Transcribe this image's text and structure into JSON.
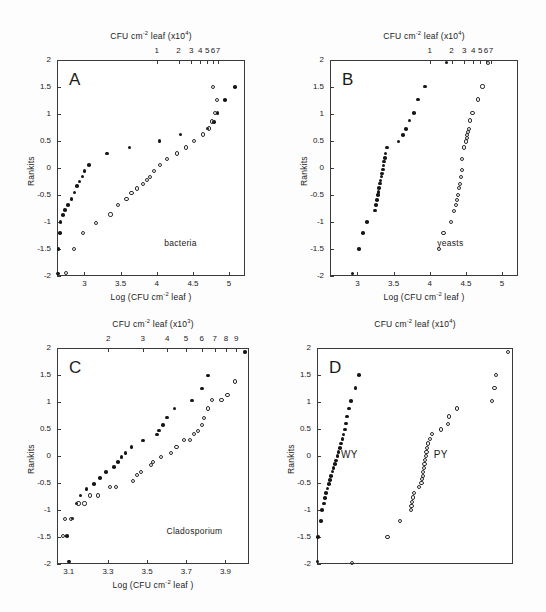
{
  "figure": {
    "y_axis_label": "Rankits",
    "y_ticks": [
      2,
      1.5,
      1,
      0.5,
      0,
      -0.5,
      -1,
      -1.5,
      -2
    ],
    "y_tick_labels": [
      "2",
      "1.5",
      "1",
      "0.5",
      "0",
      "-0.5",
      "-1",
      "-1.5",
      "-2"
    ],
    "bottom_axis_title": "Log (CFU cm-2 leaf )"
  },
  "chart_data": [
    {
      "type": "scatter",
      "panel": "A",
      "panel_letter": "A",
      "annotation": "bacteria",
      "title": "",
      "top_axis_title": "CFU cm-2 leaf (x104)",
      "top_axis_multiplier": "x10^4",
      "top_ticks": [
        1,
        2,
        3,
        4,
        5,
        6,
        7
      ],
      "top_tick_labels": [
        "1",
        "2",
        "3",
        "4",
        "5",
        "6",
        "7"
      ],
      "xlabel": "Log (CFU cm-2 leaf )",
      "x_ticks": [
        3,
        3.5,
        4,
        4.5,
        5
      ],
      "x_tick_labels": [
        "3",
        "3.5",
        "4",
        "4.5",
        "5"
      ],
      "xlim": [
        2.62,
        5.22
      ],
      "ylabel": "Rankits",
      "ylim": [
        -2,
        2
      ],
      "grid": false,
      "legend": "none",
      "series": [
        {
          "name": "filled",
          "marker": "filled-circle",
          "points": [
            [
              2.63,
              -1.95
            ],
            [
              2.64,
              -1.5
            ],
            [
              2.66,
              -1.2
            ],
            [
              2.67,
              -1.0
            ],
            [
              2.7,
              -0.87
            ],
            [
              2.73,
              -0.78
            ],
            [
              2.77,
              -0.68
            ],
            [
              2.82,
              -0.57
            ],
            [
              2.86,
              -0.45
            ],
            [
              2.9,
              -0.33
            ],
            [
              2.93,
              -0.25
            ],
            [
              2.97,
              -0.16
            ],
            [
              3.0,
              -0.06
            ],
            [
              3.06,
              0.06
            ],
            [
              3.31,
              0.27
            ],
            [
              3.62,
              0.38
            ],
            [
              4.04,
              0.5
            ],
            [
              4.33,
              0.62
            ],
            [
              4.7,
              0.73
            ],
            [
              4.79,
              0.85
            ],
            [
              4.84,
              1.02
            ],
            [
              4.94,
              1.26
            ],
            [
              5.08,
              1.5
            ]
          ]
        },
        {
          "name": "open",
          "marker": "open-circle",
          "points": [
            [
              2.74,
              -1.95
            ],
            [
              2.86,
              -1.5
            ],
            [
              2.98,
              -1.2
            ],
            [
              3.16,
              -1.02
            ],
            [
              3.36,
              -0.86
            ],
            [
              3.46,
              -0.69
            ],
            [
              3.58,
              -0.57
            ],
            [
              3.65,
              -0.47
            ],
            [
              3.73,
              -0.38
            ],
            [
              3.81,
              -0.3
            ],
            [
              3.86,
              -0.22
            ],
            [
              3.91,
              -0.16
            ],
            [
              3.96,
              -0.06
            ],
            [
              4.04,
              0.06
            ],
            [
              4.14,
              0.17
            ],
            [
              4.28,
              0.27
            ],
            [
              4.4,
              0.38
            ],
            [
              4.52,
              0.5
            ],
            [
              4.64,
              0.62
            ],
            [
              4.72,
              0.73
            ],
            [
              4.76,
              0.86
            ],
            [
              4.81,
              1.02
            ],
            [
              4.83,
              1.26
            ],
            [
              4.78,
              1.5
            ]
          ]
        }
      ]
    },
    {
      "type": "scatter",
      "panel": "B",
      "panel_letter": "B",
      "annotation": "yeasts",
      "title": "",
      "top_axis_title": "CFU cm-2 leaf (x104)",
      "top_axis_multiplier": "x10^4",
      "top_ticks": [
        1,
        2,
        3,
        4,
        5,
        6,
        7
      ],
      "top_tick_labels": [
        "1",
        "2",
        "3",
        "4",
        "5",
        "6",
        "7"
      ],
      "xlabel": "Log (CFU cm-2 leaf )",
      "x_ticks": [
        3,
        3.5,
        4,
        4.5,
        5
      ],
      "x_tick_labels": [
        "3",
        "3.5",
        "4",
        "4.5",
        "5"
      ],
      "xlim": [
        2.62,
        5.22
      ],
      "ylabel": "Rankits",
      "ylim": [
        -2,
        2
      ],
      "grid": false,
      "legend": "none",
      "series": [
        {
          "name": "filled",
          "marker": "filled-circle",
          "points": [
            [
              2.93,
              -1.95
            ],
            [
              3.02,
              -1.5
            ],
            [
              3.08,
              -1.2
            ],
            [
              3.13,
              -1.0
            ],
            [
              3.24,
              -0.79
            ],
            [
              3.26,
              -0.68
            ],
            [
              3.27,
              -0.59
            ],
            [
              3.28,
              -0.5
            ],
            [
              3.29,
              -0.44
            ],
            [
              3.3,
              -0.37
            ],
            [
              3.31,
              -0.29
            ],
            [
              3.32,
              -0.23
            ],
            [
              3.33,
              -0.16
            ],
            [
              3.34,
              -0.1
            ],
            [
              3.35,
              -0.03
            ],
            [
              3.36,
              0.05
            ],
            [
              3.37,
              0.12
            ],
            [
              3.38,
              0.19
            ],
            [
              3.39,
              0.27
            ],
            [
              3.41,
              0.38
            ],
            [
              3.57,
              0.49
            ],
            [
              3.63,
              0.61
            ],
            [
              3.67,
              0.72
            ],
            [
              3.72,
              0.88
            ],
            [
              3.78,
              1.02
            ],
            [
              3.84,
              1.27
            ],
            [
              3.93,
              1.51
            ],
            [
              4.23,
              1.95
            ]
          ]
        },
        {
          "name": "open",
          "marker": "open-circle",
          "points": [
            [
              4.13,
              -1.5
            ],
            [
              4.19,
              -1.2
            ],
            [
              4.29,
              -1.0
            ],
            [
              4.33,
              -0.79
            ],
            [
              4.36,
              -0.68
            ],
            [
              4.38,
              -0.59
            ],
            [
              4.39,
              -0.5
            ],
            [
              4.4,
              -0.37
            ],
            [
              4.42,
              -0.29
            ],
            [
              4.43,
              -0.16
            ],
            [
              4.44,
              -0.03
            ],
            [
              4.45,
              0.17
            ],
            [
              4.47,
              0.38
            ],
            [
              4.5,
              0.49
            ],
            [
              4.51,
              0.55
            ],
            [
              4.52,
              0.61
            ],
            [
              4.53,
              0.66
            ],
            [
              4.54,
              0.72
            ],
            [
              4.56,
              0.88
            ],
            [
              4.59,
              1.02
            ],
            [
              4.67,
              1.27
            ],
            [
              4.73,
              1.51
            ],
            [
              4.8,
              1.95
            ]
          ]
        }
      ]
    },
    {
      "type": "scatter",
      "panel": "C",
      "panel_letter": "C",
      "annotation": "Cladosporium",
      "title": "",
      "top_axis_title": "CFU cm-2 leaf (x103)",
      "top_axis_multiplier": "x10^3",
      "top_ticks": [
        1,
        2,
        3,
        4,
        5,
        6,
        7,
        8,
        9
      ],
      "top_tick_labels": [
        "1",
        "2",
        "3",
        "4",
        "5",
        "6",
        "7",
        "8",
        "9"
      ],
      "xlabel": "Log (CFU cm-2 leaf )",
      "x_ticks": [
        3.1,
        3.3,
        3.5,
        3.7,
        3.9
      ],
      "x_tick_labels": [
        "3.1",
        "3.3",
        "3.5",
        "3.7",
        "3.9"
      ],
      "xlim": [
        3.04,
        4.02
      ],
      "ylabel": "Rankits",
      "ylim": [
        -2,
        2
      ],
      "grid": false,
      "legend": "none",
      "series": [
        {
          "name": "filled",
          "marker": "filled-circle",
          "points": [
            [
              3.1,
              -1.95
            ],
            [
              3.09,
              -1.48
            ],
            [
              3.12,
              -1.16
            ],
            [
              3.14,
              -0.88
            ],
            [
              3.16,
              -0.73
            ],
            [
              3.19,
              -0.61
            ],
            [
              3.23,
              -0.52
            ],
            [
              3.26,
              -0.41
            ],
            [
              3.29,
              -0.3
            ],
            [
              3.33,
              -0.2
            ],
            [
              3.35,
              -0.11
            ],
            [
              3.37,
              -0.02
            ],
            [
              3.39,
              0.06
            ],
            [
              3.42,
              0.17
            ],
            [
              3.48,
              0.29
            ],
            [
              3.55,
              0.4
            ],
            [
              3.56,
              0.47
            ],
            [
              3.58,
              0.57
            ],
            [
              3.6,
              0.71
            ],
            [
              3.64,
              0.88
            ],
            [
              3.73,
              1.03
            ],
            [
              3.78,
              1.25
            ],
            [
              3.81,
              1.49
            ],
            [
              4.0,
              1.93
            ]
          ]
        },
        {
          "name": "open",
          "marker": "open-circle",
          "points": [
            [
              3.07,
              -1.48
            ],
            [
              3.08,
              -1.16
            ],
            [
              3.11,
              -1.16
            ],
            [
              3.15,
              -0.88
            ],
            [
              3.18,
              -0.88
            ],
            [
              3.21,
              -0.73
            ],
            [
              3.25,
              -0.73
            ],
            [
              3.31,
              -0.58
            ],
            [
              3.34,
              -0.58
            ],
            [
              3.43,
              -0.47
            ],
            [
              3.45,
              -0.35
            ],
            [
              3.47,
              -0.3
            ],
            [
              3.52,
              -0.16
            ],
            [
              3.53,
              -0.11
            ],
            [
              3.57,
              -0.02
            ],
            [
              3.62,
              0.06
            ],
            [
              3.65,
              0.17
            ],
            [
              3.69,
              0.29
            ],
            [
              3.72,
              0.29
            ],
            [
              3.74,
              0.4
            ],
            [
              3.76,
              0.47
            ],
            [
              3.78,
              0.57
            ],
            [
              3.79,
              0.71
            ],
            [
              3.81,
              0.88
            ],
            [
              3.83,
              1.03
            ],
            [
              3.88,
              1.03
            ],
            [
              3.91,
              1.13
            ],
            [
              3.95,
              1.38
            ],
            [
              4.0,
              1.93
            ]
          ]
        }
      ]
    },
    {
      "type": "scatter",
      "panel": "D",
      "panel_letter": "D",
      "annotations": [
        "WY",
        "PY"
      ],
      "title": "",
      "top_axis_title": "CFU cm-2 leaf (x104)",
      "top_axis_multiplier": "x10^4",
      "top_ticks": [
        0.5,
        1,
        1.5,
        2,
        2.5,
        3
      ],
      "top_tick_labels": [
        "0.5",
        "1",
        "1.5",
        "2",
        "2.5",
        "3"
      ],
      "xlabel": "",
      "x_ticks": [],
      "x_tick_labels": [],
      "xlim": [
        0.03,
        3.2
      ],
      "ylabel": "Rankits",
      "ylim": [
        -2,
        2
      ],
      "grid": false,
      "legend": "none",
      "series": [
        {
          "name": "WY",
          "marker": "filled-circle",
          "points": [
            [
              0.04,
              -1.95
            ],
            [
              0.05,
              -1.5
            ],
            [
              0.09,
              -1.2
            ],
            [
              0.11,
              -1.0
            ],
            [
              0.14,
              -0.88
            ],
            [
              0.16,
              -0.78
            ],
            [
              0.18,
              -0.68
            ],
            [
              0.2,
              -0.6
            ],
            [
              0.22,
              -0.52
            ],
            [
              0.24,
              -0.44
            ],
            [
              0.26,
              -0.37
            ],
            [
              0.28,
              -0.29
            ],
            [
              0.3,
              -0.22
            ],
            [
              0.32,
              -0.15
            ],
            [
              0.34,
              -0.08
            ],
            [
              0.36,
              0.0
            ],
            [
              0.38,
              0.07
            ],
            [
              0.4,
              0.15
            ],
            [
              0.42,
              0.23
            ],
            [
              0.44,
              0.31
            ],
            [
              0.46,
              0.4
            ],
            [
              0.48,
              0.49
            ],
            [
              0.5,
              0.6
            ],
            [
              0.52,
              0.73
            ],
            [
              0.55,
              0.88
            ],
            [
              0.58,
              1.02
            ],
            [
              0.65,
              1.26
            ],
            [
              0.71,
              1.5
            ]
          ]
        },
        {
          "name": "PY",
          "marker": "open-circle",
          "points": [
            [
              0.6,
              -1.98
            ],
            [
              1.17,
              -1.5
            ],
            [
              1.37,
              -1.2
            ],
            [
              1.55,
              -1.0
            ],
            [
              1.56,
              -0.93
            ],
            [
              1.57,
              -0.85
            ],
            [
              1.58,
              -0.77
            ],
            [
              1.6,
              -0.68
            ],
            [
              1.68,
              -0.58
            ],
            [
              1.72,
              -0.5
            ],
            [
              1.73,
              -0.42
            ],
            [
              1.74,
              -0.37
            ],
            [
              1.75,
              -0.29
            ],
            [
              1.76,
              -0.22
            ],
            [
              1.77,
              -0.15
            ],
            [
              1.78,
              -0.08
            ],
            [
              1.79,
              0.0
            ],
            [
              1.8,
              0.07
            ],
            [
              1.81,
              0.15
            ],
            [
              1.83,
              0.23
            ],
            [
              1.86,
              0.31
            ],
            [
              1.89,
              0.4
            ],
            [
              2.04,
              0.49
            ],
            [
              2.15,
              0.6
            ],
            [
              2.17,
              0.73
            ],
            [
              2.3,
              0.88
            ],
            [
              2.86,
              1.02
            ],
            [
              2.9,
              1.26
            ],
            [
              2.92,
              1.5
            ],
            [
              3.12,
              1.93
            ]
          ]
        }
      ]
    }
  ]
}
